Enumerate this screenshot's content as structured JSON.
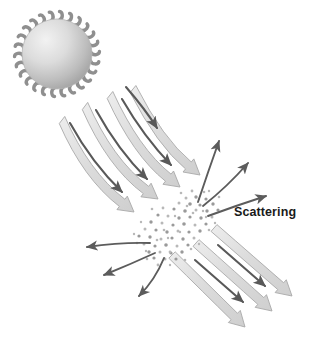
{
  "figure": {
    "title": "Scattering",
    "width": 313,
    "height": 345,
    "background": "#ffffff",
    "labels": [
      {
        "name": "scattering-label",
        "text": "Scattering",
        "x": 234,
        "y": 216,
        "color": "#1a1a1a",
        "font_size": 12.5,
        "bold": true
      }
    ],
    "sun": {
      "name": "sun",
      "cx": 57,
      "cy": 54,
      "r": 35,
      "gradient_light": "#efefef",
      "gradient_mid": "#d2d2d2",
      "gradient_dark": "#a3a3a3",
      "edge_color": "#8f8f8f",
      "tendril_count": 26,
      "tendril_length": 7.5,
      "tendril_width": 3.4
    },
    "colors": {
      "beam_fill": "#dedede",
      "beam_fill_light": "#ececec",
      "beam_stroke": "#a9a9a9",
      "thin_arrow": "#595959",
      "scatter_arrow": "#5c5c5c",
      "particle": "#b8b8b8",
      "particle_dark": "#9a9a9a"
    },
    "incoming_beams": [
      {
        "name": "incoming-beam-1",
        "x1": 62,
        "y1": 120,
        "cx": 86,
        "cy": 175,
        "x2": 134,
        "y2": 212,
        "width": 9
      },
      {
        "name": "incoming-beam-2",
        "x1": 85,
        "y1": 106,
        "cx": 110,
        "cy": 163,
        "x2": 158,
        "y2": 199,
        "width": 9
      },
      {
        "name": "incoming-beam-3",
        "x1": 110,
        "y1": 95,
        "cx": 136,
        "cy": 152,
        "x2": 180,
        "y2": 187,
        "width": 9
      },
      {
        "name": "incoming-beam-4",
        "x1": 133,
        "y1": 89,
        "cx": 160,
        "cy": 142,
        "x2": 200,
        "y2": 175,
        "width": 9
      }
    ],
    "incoming_thin_arrows": [
      {
        "name": "incoming-thin-arrow-1",
        "x1": 70,
        "y1": 123,
        "cx": 92,
        "cy": 163,
        "x2": 122,
        "y2": 192
      },
      {
        "name": "incoming-thin-arrow-2",
        "x1": 96,
        "y1": 110,
        "cx": 118,
        "cy": 150,
        "x2": 147,
        "y2": 179
      },
      {
        "name": "incoming-thin-arrow-3",
        "x1": 122,
        "y1": 99,
        "cx": 144,
        "cy": 137,
        "x2": 171,
        "y2": 165
      },
      {
        "name": "incoming-thin-arrow-4",
        "x1": 126,
        "y1": 87,
        "cx": 145,
        "cy": 109,
        "x2": 157,
        "y2": 128
      }
    ],
    "outgoing_beams": [
      {
        "name": "outgoing-beam-1",
        "x1": 172,
        "y1": 255,
        "x2": 245,
        "y2": 327,
        "width": 9
      },
      {
        "name": "outgoing-beam-2",
        "x1": 196,
        "y1": 243,
        "x2": 272,
        "y2": 311,
        "width": 9
      },
      {
        "name": "outgoing-beam-3",
        "x1": 214,
        "y1": 228,
        "x2": 292,
        "y2": 296,
        "width": 9
      }
    ],
    "outgoing_thin_arrows": [
      {
        "name": "outgoing-thin-arrow-1",
        "x1": 195,
        "y1": 260,
        "x2": 243,
        "y2": 302
      },
      {
        "name": "outgoing-thin-arrow-2",
        "x1": 218,
        "y1": 245,
        "x2": 265,
        "y2": 286
      }
    ],
    "scatter_arrows": [
      {
        "name": "scatter-arrow-up-left",
        "x1": 198,
        "y1": 202,
        "cx": 208,
        "cy": 172,
        "x2": 219,
        "y2": 141
      },
      {
        "name": "scatter-arrow-up-right",
        "x1": 203,
        "y1": 206,
        "cx": 228,
        "cy": 186,
        "x2": 248,
        "y2": 163
      },
      {
        "name": "scatter-arrow-right",
        "x1": 208,
        "y1": 216,
        "cx": 238,
        "cy": 205,
        "x2": 266,
        "y2": 196
      },
      {
        "name": "scatter-arrow-left",
        "x1": 150,
        "y1": 243,
        "cx": 122,
        "cy": 242,
        "x2": 87,
        "y2": 247
      },
      {
        "name": "scatter-arrow-down-left",
        "x1": 155,
        "y1": 253,
        "cx": 131,
        "cy": 264,
        "x2": 104,
        "y2": 275
      },
      {
        "name": "scatter-arrow-down",
        "x1": 164,
        "y1": 258,
        "cx": 155,
        "cy": 280,
        "x2": 139,
        "y2": 296
      }
    ],
    "particles": [
      {
        "x": 196,
        "y": 197,
        "r": 1.7
      },
      {
        "x": 206,
        "y": 199,
        "r": 1.6
      },
      {
        "x": 186,
        "y": 198,
        "r": 1.5
      },
      {
        "x": 213,
        "y": 204,
        "r": 1.7
      },
      {
        "x": 200,
        "y": 205,
        "r": 1.6
      },
      {
        "x": 190,
        "y": 204,
        "r": 1.8
      },
      {
        "x": 179,
        "y": 203,
        "r": 1.5
      },
      {
        "x": 218,
        "y": 210,
        "r": 1.6
      },
      {
        "x": 207,
        "y": 211,
        "r": 1.7
      },
      {
        "x": 196,
        "y": 210,
        "r": 1.5
      },
      {
        "x": 185,
        "y": 211,
        "r": 1.8
      },
      {
        "x": 174,
        "y": 209,
        "r": 1.6
      },
      {
        "x": 212,
        "y": 217,
        "r": 1.5
      },
      {
        "x": 201,
        "y": 218,
        "r": 1.7
      },
      {
        "x": 190,
        "y": 217,
        "r": 1.6
      },
      {
        "x": 179,
        "y": 218,
        "r": 1.7
      },
      {
        "x": 168,
        "y": 216,
        "r": 1.5
      },
      {
        "x": 158,
        "y": 215,
        "r": 1.6
      },
      {
        "x": 206,
        "y": 224,
        "r": 1.6
      },
      {
        "x": 195,
        "y": 225,
        "r": 1.5
      },
      {
        "x": 184,
        "y": 224,
        "r": 1.8
      },
      {
        "x": 173,
        "y": 225,
        "r": 1.6
      },
      {
        "x": 162,
        "y": 223,
        "r": 1.5
      },
      {
        "x": 151,
        "y": 222,
        "r": 1.7
      },
      {
        "x": 200,
        "y": 231,
        "r": 1.7
      },
      {
        "x": 189,
        "y": 232,
        "r": 1.6
      },
      {
        "x": 178,
        "y": 231,
        "r": 1.5
      },
      {
        "x": 167,
        "y": 232,
        "r": 1.7
      },
      {
        "x": 156,
        "y": 230,
        "r": 1.6
      },
      {
        "x": 145,
        "y": 229,
        "r": 1.5
      },
      {
        "x": 194,
        "y": 238,
        "r": 1.5
      },
      {
        "x": 183,
        "y": 239,
        "r": 1.7
      },
      {
        "x": 172,
        "y": 238,
        "r": 1.6
      },
      {
        "x": 161,
        "y": 239,
        "r": 1.5
      },
      {
        "x": 150,
        "y": 237,
        "r": 1.7
      },
      {
        "x": 139,
        "y": 236,
        "r": 1.6
      },
      {
        "x": 188,
        "y": 245,
        "r": 1.6
      },
      {
        "x": 177,
        "y": 246,
        "r": 1.5
      },
      {
        "x": 166,
        "y": 245,
        "r": 1.8
      },
      {
        "x": 155,
        "y": 246,
        "r": 1.6
      },
      {
        "x": 144,
        "y": 244,
        "r": 1.5
      },
      {
        "x": 182,
        "y": 252,
        "r": 1.7
      },
      {
        "x": 171,
        "y": 253,
        "r": 1.6
      },
      {
        "x": 160,
        "y": 252,
        "r": 1.5
      },
      {
        "x": 149,
        "y": 252,
        "r": 1.7
      },
      {
        "x": 176,
        "y": 259,
        "r": 1.6
      },
      {
        "x": 165,
        "y": 259,
        "r": 1.5
      },
      {
        "x": 154,
        "y": 258,
        "r": 1.6
      },
      {
        "x": 192,
        "y": 191,
        "r": 1.4
      },
      {
        "x": 204,
        "y": 192,
        "r": 1.3
      },
      {
        "x": 181,
        "y": 193,
        "r": 1.3
      },
      {
        "x": 170,
        "y": 252,
        "r": 1.4
      },
      {
        "x": 158,
        "y": 265,
        "r": 1.4
      },
      {
        "x": 147,
        "y": 259,
        "r": 1.3
      },
      {
        "x": 219,
        "y": 197,
        "r": 1.3
      },
      {
        "x": 137,
        "y": 243,
        "r": 1.3
      },
      {
        "x": 209,
        "y": 191,
        "r": 1.2
      },
      {
        "x": 163,
        "y": 208,
        "r": 1.4
      },
      {
        "x": 152,
        "y": 209,
        "r": 1.3
      },
      {
        "x": 141,
        "y": 222,
        "r": 1.2
      },
      {
        "x": 199,
        "y": 199,
        "r": 1.2
      },
      {
        "x": 187,
        "y": 206,
        "r": 1.3
      },
      {
        "x": 175,
        "y": 216,
        "r": 1.2
      },
      {
        "x": 206,
        "y": 217,
        "r": 1.2
      },
      {
        "x": 193,
        "y": 213,
        "r": 1.3
      },
      {
        "x": 168,
        "y": 238,
        "r": 1.2
      },
      {
        "x": 157,
        "y": 240,
        "r": 1.3
      },
      {
        "x": 180,
        "y": 232,
        "r": 1.2
      },
      {
        "x": 191,
        "y": 249,
        "r": 1.3
      },
      {
        "x": 203,
        "y": 211,
        "r": 1.2
      },
      {
        "x": 146,
        "y": 251,
        "r": 1.2
      },
      {
        "x": 164,
        "y": 230,
        "r": 1.3
      },
      {
        "x": 134,
        "y": 234,
        "r": 1.2
      },
      {
        "x": 215,
        "y": 223,
        "r": 1.2
      },
      {
        "x": 209,
        "y": 230,
        "r": 1.3
      },
      {
        "x": 199,
        "y": 244,
        "r": 1.2
      },
      {
        "x": 185,
        "y": 260,
        "r": 1.3
      },
      {
        "x": 170,
        "y": 265,
        "r": 1.2
      }
    ]
  }
}
